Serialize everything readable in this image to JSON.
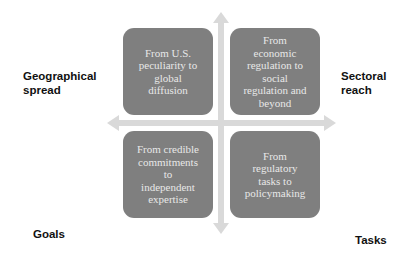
{
  "diagram": {
    "type": "quadrant",
    "axis_color": "#d9d9d9",
    "box_color": "#7f7f7f",
    "box_text_color": "#e8e8e8",
    "axis_labels": {
      "left": "Geographical\nspread",
      "right": "Sectoral\nreach",
      "bottom_left": "Goals",
      "bottom_right": "Tasks"
    },
    "quadrants": [
      {
        "position": "top-left",
        "text": "From U.S.\npeculiarity to\nglobal\ndiffusion"
      },
      {
        "position": "top-right",
        "text": "From\neconomic\nregulation to\nsocial\nregulation and\nbeyond"
      },
      {
        "position": "bottom-left",
        "text": "From credible\ncommitments\nto\nindependent\nexpertise"
      },
      {
        "position": "bottom-right",
        "text": "From\nregulatory\ntasks to\npolicymaking"
      }
    ]
  }
}
